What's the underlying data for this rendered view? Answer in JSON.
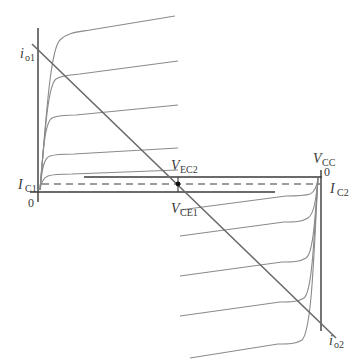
{
  "diagram": {
    "title": "",
    "colors": {
      "background": "#ffffff",
      "axis": "#3a3a3a",
      "curve": "#8a8a8a",
      "load_line": "#6a6a6a",
      "dashed": "#3a3a3a",
      "q_point": "#111111"
    },
    "labels": {
      "io1": {
        "main": "i",
        "sub": "o1"
      },
      "io2": {
        "main": "i",
        "sub": "o2"
      },
      "ic1": {
        "main": "I",
        "sub": "C1"
      },
      "ic2": {
        "main": "I",
        "sub": "C2"
      },
      "vec2": {
        "main": "V",
        "sub": "EC2"
      },
      "vce1": {
        "main": "V",
        "sub": "CE1"
      },
      "vcc": {
        "main": "V",
        "sub": "CC"
      },
      "origin_left": "0",
      "origin_right": "0"
    },
    "elements": {
      "left_characteristic_curves": 5,
      "right_characteristic_curves": 5,
      "load_line": "diagonal from upper-left (i_o1) to lower-right (i_o2)",
      "q_point": "intersection of load line and dashed quiescent current line",
      "dashed_line": "quiescent collector current I_C1 = I_C2"
    }
  }
}
